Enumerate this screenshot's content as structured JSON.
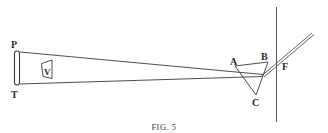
{
  "figure": {
    "caption": "FIG. 5",
    "labels": {
      "P": "P",
      "T": "T",
      "V": "V",
      "A": "A",
      "B": "B",
      "C": "C",
      "F": "F"
    },
    "colors": {
      "stroke": "#3a3a3a",
      "background": "#ffffff"
    }
  }
}
